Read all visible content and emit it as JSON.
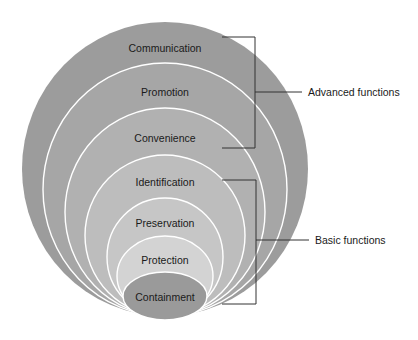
{
  "diagram": {
    "title": "",
    "layers": [
      {
        "label": "Communication",
        "group": "advanced",
        "color": "#9c9c9c",
        "cx": 165,
        "cy": 169,
        "rx": 143,
        "ry": 147,
        "text_y": 52
      },
      {
        "label": "Promotion",
        "group": "advanced",
        "color": "#a6a6a6",
        "cx": 165,
        "cy": 189.5,
        "rx": 122,
        "ry": 126.5,
        "text_y": 96
      },
      {
        "label": "Convenience",
        "group": "advanced",
        "color": "#b1b1b1",
        "cx": 165,
        "cy": 212,
        "rx": 100,
        "ry": 104,
        "text_y": 142
      },
      {
        "label": "Identification",
        "group": "basic",
        "color": "#bdbdbd",
        "cx": 165,
        "cy": 235.5,
        "rx": 80,
        "ry": 80.5,
        "text_y": 186
      },
      {
        "label": "Preservation",
        "group": "basic",
        "color": "#c6c6c6",
        "cx": 165,
        "cy": 257,
        "rx": 58,
        "ry": 59,
        "text_y": 227
      },
      {
        "label": "Protection",
        "group": "basic",
        "color": "#d3d3d3",
        "cx": 165,
        "cy": 276,
        "rx": 48,
        "ry": 40,
        "text_y": 264
      },
      {
        "label": "Containment",
        "group": "basic",
        "color": "#9a9a9a",
        "cx": 165,
        "cy": 296,
        "rx": 42,
        "ry": 24,
        "text_y": 301
      }
    ],
    "groups": {
      "advanced": {
        "label": "Advanced functions",
        "bracket_top": 37,
        "bracket_bottom": 148,
        "bracket_x": 255,
        "label_y": 96
      },
      "basic": {
        "label": "Basic functions",
        "bracket_top": 180,
        "bracket_bottom": 304,
        "bracket_x": 256,
        "label_y": 244
      }
    }
  }
}
